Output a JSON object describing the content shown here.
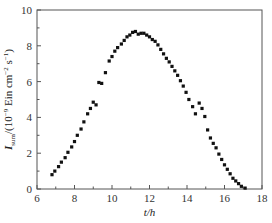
{
  "chart_data": {
    "type": "scatter",
    "title": "",
    "xlabel": "t/h",
    "ylabel": "I_sum/(10^-9 Ein cm^-2 s^-1)",
    "ylabel_parts": {
      "main": "I",
      "sub": "sum",
      "rest1": "/(10",
      "sup1": "−9",
      "rest2": " Ein cm",
      "sup2": "−2",
      "rest3": " s",
      "sup3": "−1",
      "rest4": ")"
    },
    "xlim": [
      6,
      18
    ],
    "ylim": [
      0,
      10
    ],
    "xticks": [
      6,
      8,
      10,
      12,
      14,
      16,
      18
    ],
    "yticks": [
      0,
      2,
      4,
      6,
      8,
      10
    ],
    "grid": false,
    "legend": null,
    "marker": "square",
    "marker_color": "#111111",
    "series": [
      {
        "name": "I_sum",
        "points": [
          [
            6.8,
            0.8
          ],
          [
            6.95,
            1.0
          ],
          [
            7.15,
            1.25
          ],
          [
            7.3,
            1.5
          ],
          [
            7.5,
            1.75
          ],
          [
            7.65,
            2.05
          ],
          [
            7.85,
            2.35
          ],
          [
            8.0,
            2.65
          ],
          [
            8.15,
            3.0
          ],
          [
            8.35,
            3.35
          ],
          [
            8.5,
            3.75
          ],
          [
            8.7,
            4.2
          ],
          [
            8.85,
            4.5
          ],
          [
            9.0,
            4.85
          ],
          [
            9.15,
            4.7
          ],
          [
            9.3,
            5.95
          ],
          [
            9.45,
            5.9
          ],
          [
            9.65,
            6.5
          ],
          [
            9.85,
            7.15
          ],
          [
            10.0,
            7.4
          ],
          [
            10.15,
            7.7
          ],
          [
            10.3,
            7.9
          ],
          [
            10.5,
            8.1
          ],
          [
            10.65,
            8.3
          ],
          [
            10.8,
            8.5
          ],
          [
            10.95,
            8.6
          ],
          [
            11.1,
            8.75
          ],
          [
            11.25,
            8.8
          ],
          [
            11.4,
            8.65
          ],
          [
            11.55,
            8.7
          ],
          [
            11.7,
            8.7
          ],
          [
            11.85,
            8.6
          ],
          [
            12.0,
            8.5
          ],
          [
            12.15,
            8.35
          ],
          [
            12.3,
            8.25
          ],
          [
            12.45,
            8.05
          ],
          [
            12.6,
            7.8
          ],
          [
            12.75,
            7.55
          ],
          [
            12.9,
            7.3
          ],
          [
            13.05,
            7.1
          ],
          [
            13.2,
            6.85
          ],
          [
            13.35,
            6.6
          ],
          [
            13.5,
            6.35
          ],
          [
            13.65,
            6.05
          ],
          [
            13.8,
            5.75
          ],
          [
            13.95,
            5.4
          ],
          [
            14.1,
            5.0
          ],
          [
            14.3,
            4.6
          ],
          [
            14.45,
            4.2
          ],
          [
            14.65,
            4.8
          ],
          [
            14.8,
            4.5
          ],
          [
            14.95,
            4.05
          ],
          [
            15.1,
            3.3
          ],
          [
            15.25,
            2.85
          ],
          [
            15.4,
            2.55
          ],
          [
            15.55,
            2.3
          ],
          [
            15.7,
            1.95
          ],
          [
            15.85,
            1.65
          ],
          [
            16.0,
            1.35
          ],
          [
            16.15,
            1.1
          ],
          [
            16.3,
            0.85
          ],
          [
            16.45,
            0.6
          ],
          [
            16.6,
            0.45
          ],
          [
            16.75,
            0.3
          ],
          [
            16.9,
            0.15
          ],
          [
            17.1,
            0.05
          ]
        ]
      }
    ]
  }
}
